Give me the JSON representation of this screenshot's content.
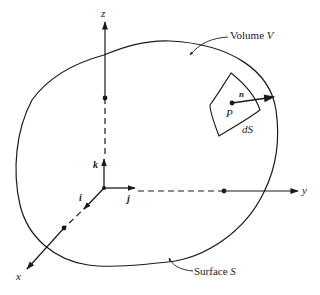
{
  "diagram": {
    "type": "vector-calculus-figure",
    "axes": {
      "x": {
        "label": "x"
      },
      "y": {
        "label": "y"
      },
      "z": {
        "label": "z"
      }
    },
    "unit_vectors": {
      "i": {
        "label": "i"
      },
      "j": {
        "label": "j"
      },
      "k": {
        "label": "k"
      }
    },
    "surface_element": {
      "point_label": "P",
      "normal_label": "n",
      "area_label": "dS"
    },
    "callouts": {
      "volume": {
        "text": "Volume ",
        "symbol": "V"
      },
      "surface": {
        "text": "Surface ",
        "symbol": "S"
      }
    },
    "colors": {
      "ink": "#1a1a1a",
      "background": "#ffffff"
    }
  }
}
